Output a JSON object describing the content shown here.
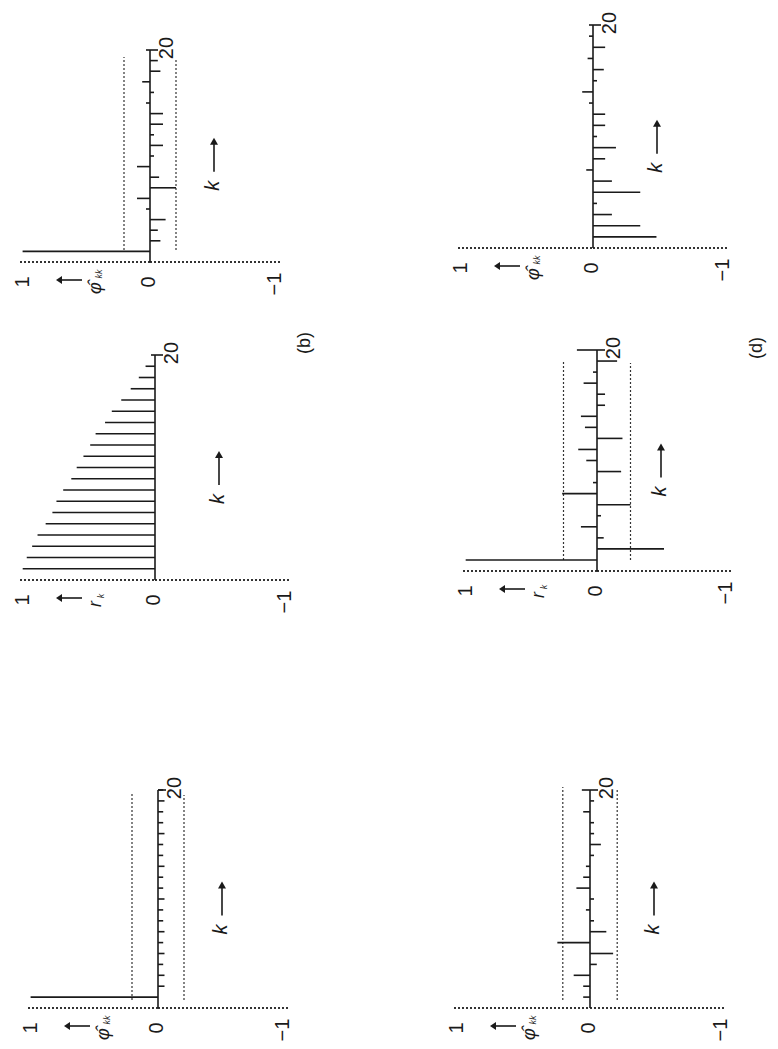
{
  "figure": {
    "orientation": "rotated-90-ccw",
    "panel_labels": [
      {
        "text": "(b)",
        "x": 305,
        "y": 343
      },
      {
        "text": "(d)",
        "x": 757,
        "y": 348
      }
    ],
    "colors": {
      "ink": "#1a1a1a",
      "background": "#ffffff"
    }
  },
  "chart_data": [
    {
      "type": "bar",
      "id": "panel-a-pacf",
      "title": "",
      "ylabel": "φ̂kk",
      "xlabel": "k",
      "x_ticks": [
        "0",
        "20"
      ],
      "y_ticks": [
        "1",
        "0",
        "−1"
      ],
      "ylim": [
        -1,
        1
      ],
      "xlim": [
        0,
        20
      ],
      "confidence_bound": 0.2,
      "x": [
        1,
        2,
        3,
        4,
        5,
        6,
        7,
        8,
        9,
        10,
        11,
        12,
        13,
        14,
        15,
        16,
        17,
        18,
        19,
        20
      ],
      "values": [
        0.98,
        -0.05,
        -0.05,
        -0.04,
        -0.05,
        -0.04,
        -0.05,
        -0.04,
        -0.04,
        -0.05,
        -0.04,
        -0.04,
        -0.05,
        -0.04,
        -0.04,
        -0.05,
        -0.04,
        -0.04,
        -0.05,
        -0.04
      ],
      "geom": {
        "x0": 158,
        "yb": 1008,
        "yt": 790,
        "scale": 130,
        "bound_top": 792,
        "bound_bot": 1000
      }
    },
    {
      "type": "bar",
      "id": "panel-b-acf",
      "title": "",
      "ylabel": "rk",
      "xlabel": "k",
      "x_ticks": [
        "0",
        "20"
      ],
      "y_ticks": [
        "1",
        "0",
        "−1"
      ],
      "ylim": [
        -1,
        1
      ],
      "xlim": [
        0,
        20
      ],
      "confidence_bound": null,
      "x": [
        1,
        2,
        3,
        4,
        5,
        6,
        7,
        8,
        9,
        10,
        11,
        12,
        13,
        14,
        15,
        16,
        17,
        18,
        19,
        20
      ],
      "values": [
        0.98,
        0.95,
        0.91,
        0.87,
        0.81,
        0.76,
        0.73,
        0.68,
        0.62,
        0.58,
        0.53,
        0.48,
        0.44,
        0.37,
        0.32,
        0.25,
        0.18,
        0.12,
        0.07,
        0.02
      ],
      "geom": {
        "x0": 155,
        "yb": 580,
        "yt": 355,
        "scale": 135,
        "bound_top": null,
        "bound_bot": null
      }
    },
    {
      "type": "bar",
      "id": "panel-b-pacf",
      "title": "(b)",
      "ylabel": "φ̂kk",
      "xlabel": "k",
      "x_ticks": [
        "0",
        "20"
      ],
      "y_ticks": [
        "1",
        "0",
        "−1"
      ],
      "ylim": [
        -1,
        1
      ],
      "xlim": [
        0,
        20
      ],
      "confidence_bound": 0.2,
      "x": [
        1,
        2,
        3,
        4,
        5,
        6,
        7,
        8,
        9,
        10,
        11,
        12,
        13,
        14,
        15,
        16,
        17,
        18,
        19,
        20
      ],
      "values": [
        0.98,
        -0.08,
        -0.06,
        -0.12,
        0.03,
        0.1,
        -0.2,
        -0.07,
        0.1,
        -0.03,
        -0.1,
        -0.03,
        -0.1,
        -0.1,
        0.03,
        -0.03,
        0.06,
        -0.08,
        -0.06,
        0.0
      ],
      "geom": {
        "x0": 150,
        "yb": 262,
        "yt": 50,
        "scale": 130,
        "bound_top": 57,
        "bound_bot": 250
      }
    },
    {
      "type": "bar",
      "id": "panel-c-pacf",
      "title": "",
      "ylabel": "φ̂kk",
      "xlabel": "k",
      "x_ticks": [
        "0",
        "20"
      ],
      "y_ticks": [
        "1",
        "0",
        "−1"
      ],
      "ylim": [
        -1,
        1
      ],
      "xlim": [
        0,
        20
      ],
      "confidence_bound": 0.2,
      "x": [
        1,
        2,
        3,
        4,
        5,
        6,
        7,
        8,
        9,
        10,
        11,
        12,
        13,
        14,
        15,
        16,
        17,
        18,
        19,
        20
      ],
      "values": [
        0.05,
        0.05,
        0.12,
        -0.05,
        -0.17,
        0.24,
        -0.12,
        -0.02,
        0.03,
        -0.02,
        0.1,
        0.05,
        0.03,
        -0.02,
        -0.08,
        -0.03,
        -0.02,
        0.05,
        -0.03,
        0.06
      ],
      "geom": {
        "x0": 590,
        "yb": 1008,
        "yt": 790,
        "scale": 136,
        "bound_top": 787,
        "bound_bot": 1000
      }
    },
    {
      "type": "bar",
      "id": "panel-d-acf",
      "title": "(d)",
      "ylabel": "rk",
      "xlabel": "k",
      "x_ticks": [
        "0",
        "20"
      ],
      "y_ticks": [
        "1",
        "0",
        "−1"
      ],
      "ylim": [
        -1,
        1
      ],
      "xlim": [
        0,
        20
      ],
      "confidence_bound": 0.25,
      "x": [
        1,
        2,
        3,
        4,
        5,
        6,
        7,
        8,
        9,
        10,
        11,
        12,
        13,
        14,
        15,
        16,
        17,
        18,
        19,
        20
      ],
      "values": [
        0.98,
        -0.5,
        -0.05,
        0.12,
        -0.03,
        -0.25,
        0.26,
        0.0,
        -0.18,
        0.08,
        0.14,
        -0.19,
        0.09,
        0.12,
        -0.06,
        -0.06,
        0.1,
        0.0,
        -0.15,
        0.15
      ],
      "geom": {
        "x0": 597,
        "yb": 571,
        "yt": 350,
        "scale": 134,
        "bound_top": 360,
        "bound_bot": 560
      }
    },
    {
      "type": "bar",
      "id": "panel-d-pacf",
      "title": "",
      "ylabel": "φ̂kk",
      "xlabel": "k",
      "x_ticks": [
        "0",
        "20"
      ],
      "y_ticks": [
        "1",
        "0",
        "−1"
      ],
      "ylim": [
        -1,
        1
      ],
      "xlim": [
        0,
        20
      ],
      "confidence_bound": null,
      "x": [
        1,
        2,
        3,
        4,
        5,
        6,
        7,
        8,
        9,
        10,
        11,
        12,
        13,
        14,
        15,
        16,
        17,
        18,
        19,
        20
      ],
      "values": [
        -0.47,
        -0.35,
        -0.14,
        -0.02,
        -0.35,
        -0.14,
        0.05,
        -0.09,
        -0.17,
        -0.03,
        -0.09,
        -0.09,
        0.0,
        0.08,
        -0.02,
        -0.08,
        0.04,
        -0.09,
        0.0,
        0.0
      ],
      "geom": {
        "x0": 593,
        "yb": 248,
        "yt": 25,
        "scale": 135,
        "bound_top": null,
        "bound_bot": null
      }
    }
  ]
}
